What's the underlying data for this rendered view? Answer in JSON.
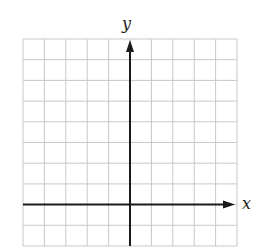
{
  "diagram": {
    "type": "coordinate-grid",
    "grid": {
      "columns": 10,
      "rows": 10,
      "left": 23,
      "top": 39,
      "right": 237,
      "bottom": 246,
      "line_color": "#c8c8c8"
    },
    "axes": {
      "color": "#1a1a1a",
      "x_axis": {
        "label": "x",
        "row_index": 8,
        "arrow": "right"
      },
      "y_axis": {
        "label": "y",
        "column_index": 5,
        "arrow": "up"
      }
    }
  }
}
